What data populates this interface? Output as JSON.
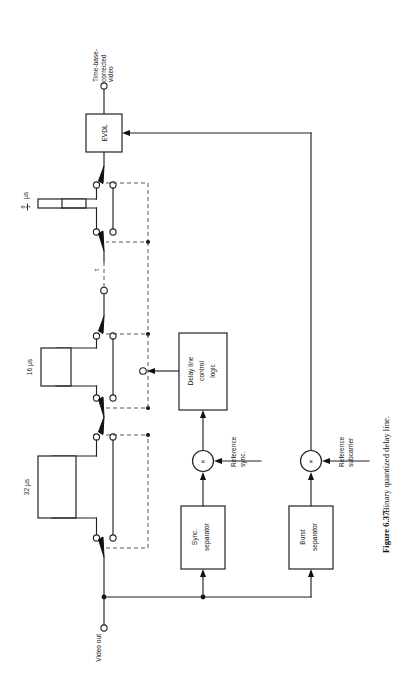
{
  "figure": {
    "number": "Figure 6.37",
    "caption": "Binary quantized delay line.",
    "orientation": "rotated-90-ccw"
  },
  "terminals": [
    {
      "id": "tbc-video",
      "label_lines": [
        "Time-base-",
        "corrected",
        "video"
      ],
      "label": "Time-base-corrected video"
    },
    {
      "id": "video-out",
      "label_lines": [
        "Video out"
      ],
      "label": "Video out"
    }
  ],
  "blocks": [
    {
      "id": "evdl",
      "label_lines": [
        "EVDL"
      ],
      "label": "EVDL"
    },
    {
      "id": "delay-line-control-logic",
      "label_lines": [
        "Delay line",
        "control",
        "logic"
      ],
      "label": "Delay line control logic"
    },
    {
      "id": "sync-separator",
      "label_lines": [
        "Sync.",
        "separator"
      ],
      "label": "Sync. separator"
    },
    {
      "id": "burst-separator",
      "label_lines": [
        "Burst",
        "separator"
      ],
      "label": "Burst separator"
    }
  ],
  "delay_sections": [
    {
      "id": "delay-eighth-us",
      "value": "1/8",
      "numerator": "1",
      "denominator": "8",
      "unit": "µs",
      "label": "1/8 µs"
    },
    {
      "id": "delay-tau",
      "value": "τ",
      "unit": "",
      "label": "τ"
    },
    {
      "id": "delay-16-us",
      "value": "16",
      "unit": "µs",
      "label": "16 µs"
    },
    {
      "id": "delay-32-us",
      "value": "32",
      "unit": "µs",
      "label": "32 µs"
    }
  ],
  "multipliers": [
    {
      "id": "sync-multiplier",
      "symbol": "×",
      "input_label_lines": [
        "Reference",
        "sync."
      ],
      "input_label": "Reference sync."
    },
    {
      "id": "subcarrier-multiplier",
      "symbol": "×",
      "input_label_lines": [
        "Reference",
        "subcarrier"
      ],
      "input_label": "Reference subcarrier"
    }
  ],
  "colors": {
    "background": "#ffffff",
    "line": "#222222",
    "dashed_control": "#555555",
    "text": "#1a1a1a"
  }
}
